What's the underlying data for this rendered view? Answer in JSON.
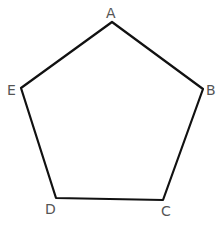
{
  "diagram": {
    "shape": "pentagon",
    "colors": {
      "outline": "#111111",
      "median": "#777777",
      "label": "#555555",
      "background": "#ffffff"
    },
    "center": {
      "x": 110,
      "y": 116
    },
    "vertices": [
      {
        "label": "A",
        "x": 112,
        "y": 22,
        "label_x": 106,
        "label_y": 18
      },
      {
        "label": "B",
        "x": 203,
        "y": 89,
        "label_x": 206,
        "label_y": 95
      },
      {
        "label": "C",
        "x": 163,
        "y": 200,
        "label_x": 161,
        "label_y": 216
      },
      {
        "label": "D",
        "x": 56,
        "y": 198,
        "label_x": 45,
        "label_y": 214
      },
      {
        "label": "E",
        "x": 21,
        "y": 88,
        "label_x": 7,
        "label_y": 95
      }
    ],
    "side_midpoints": [
      {
        "side": "AB",
        "x": 157,
        "y": 55
      },
      {
        "side": "BC",
        "x": 183,
        "y": 144
      },
      {
        "side": "CD",
        "x": 108,
        "y": 199
      },
      {
        "side": "DE",
        "x": 38,
        "y": 143
      },
      {
        "side": "EA",
        "x": 68,
        "y": 53
      }
    ],
    "medians": [
      {
        "from": "A",
        "to_midpoint_of": "CD"
      },
      {
        "from": "B",
        "to_midpoint_of": "DE"
      },
      {
        "from": "C",
        "to_midpoint_of": "EA"
      },
      {
        "from": "D",
        "to_midpoint_of": "AB"
      },
      {
        "from": "E",
        "to_midpoint_of": "BC"
      }
    ],
    "line_style": "dashed"
  }
}
